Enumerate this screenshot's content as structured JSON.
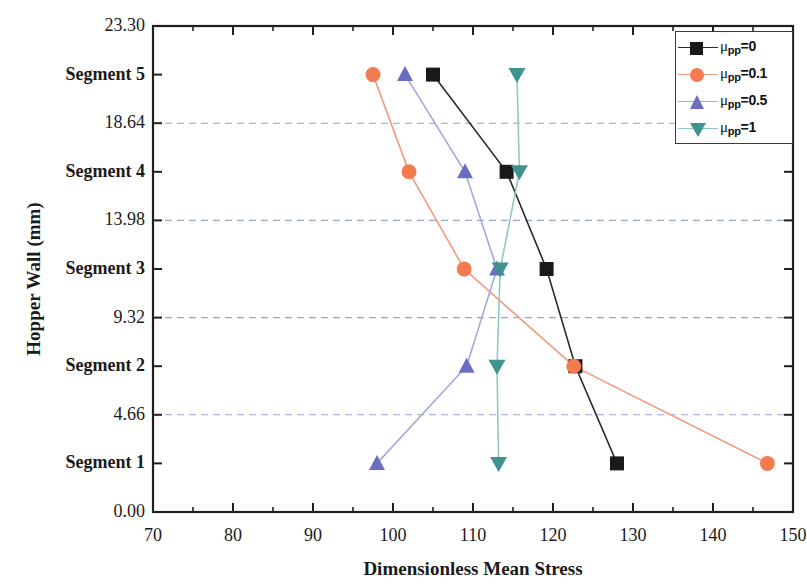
{
  "chart_data": {
    "type": "line",
    "title": "",
    "xlabel": "Dimensionless Mean Stress",
    "ylabel": "Hopper Wall (mm)",
    "xlim": [
      70,
      150
    ],
    "ylim": [
      0.0,
      23.3
    ],
    "xticks": [
      70,
      80,
      90,
      100,
      110,
      120,
      130,
      140,
      150
    ],
    "xtick_labels": [
      "70",
      "80",
      "90",
      "100",
      "110",
      "120",
      "130",
      "140",
      "150"
    ],
    "x_minor_tick_step": 5,
    "yticks": [
      0.0,
      2.33,
      4.66,
      6.99,
      9.32,
      11.65,
      13.98,
      16.31,
      18.64,
      20.97,
      23.3
    ],
    "ytick_labels": [
      "0.00",
      "Segment 1",
      "4.66",
      "Segment 2",
      "9.32",
      "Segment 3",
      "13.98",
      "Segment 4",
      "18.64",
      "Segment 5",
      "23.30"
    ],
    "grid": "horizontal-dashed",
    "grid_values": [
      4.66,
      9.32,
      13.98,
      18.64
    ],
    "grid_color": "#8a93c8",
    "categories": [
      "Segment 1",
      "Segment 2",
      "Segment 3",
      "Segment 4",
      "Segment 5"
    ],
    "category_y": [
      2.33,
      6.99,
      11.65,
      16.31,
      20.97
    ],
    "legend_position": "top-right",
    "series": [
      {
        "name": "μpp=0",
        "label_mu": "μ",
        "label_sub": "pp",
        "label_value": "=0",
        "marker": "square",
        "color": "#1a1a1a",
        "line_color": "#2b2b2b",
        "values": [
          128.0,
          122.8,
          119.2,
          114.2,
          105.0
        ]
      },
      {
        "name": "μpp=0.1",
        "label_mu": "μ",
        "label_sub": "pp",
        "label_value": "=0.1",
        "marker": "circle",
        "color": "#f47b50",
        "line_color": "#f09a80",
        "values": [
          146.8,
          122.6,
          108.9,
          102.0,
          97.5
        ]
      },
      {
        "name": "μpp=0.5",
        "label_mu": "μ",
        "label_sub": "pp",
        "label_value": "=0.5",
        "marker": "triangle-up",
        "color": "#6a6ec0",
        "line_color": "#a3a7dd",
        "values": [
          98.0,
          109.2,
          113.0,
          109.0,
          101.5
        ]
      },
      {
        "name": "μpp=1",
        "label_mu": "μ",
        "label_sub": "pp",
        "label_value": "=1",
        "marker": "triangle-down",
        "color": "#3f938e",
        "line_color": "#8fc9c6",
        "values": [
          113.2,
          113.0,
          113.4,
          115.8,
          115.5
        ]
      }
    ]
  },
  "axes": {
    "y_title": "Hopper Wall (mm)",
    "x_title": "Dimensionless Mean Stress"
  }
}
